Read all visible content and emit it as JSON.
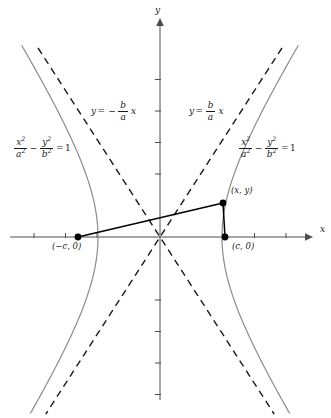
{
  "figure": {
    "type": "hyperbola-diagram",
    "width": 331,
    "height": 418,
    "background": "#ffffff",
    "curve_color": "#8c8c8c",
    "axis_color": "#4d4d4d",
    "asymptote_color": "#1a1a1a",
    "segment_color": "#000000",
    "text_color": "#1a1a1a"
  },
  "axes": {
    "x_label": "x",
    "y_label": "y",
    "origin": {
      "x": 160,
      "y": 237
    },
    "x_range": [
      10,
      312
    ],
    "y_range": [
      20,
      400
    ],
    "tick_spacing": 31.5,
    "x_ticks": [
      -4,
      -3,
      -2,
      2,
      3,
      4
    ],
    "y_ticks": [
      -5,
      -4,
      -3,
      -2,
      2,
      3,
      4,
      5
    ]
  },
  "chart_data": {
    "type": "line",
    "title": "",
    "xlabel": "x",
    "ylabel": "y",
    "curves": [
      {
        "name": "hyperbola-right-branch",
        "equation": "x^2/a^2 - y^2/b^2 = 1",
        "style": "solid",
        "color": "#8c8c8c"
      },
      {
        "name": "hyperbola-left-branch",
        "equation": "x^2/a^2 - y^2/b^2 = 1",
        "style": "solid",
        "color": "#8c8c8c"
      },
      {
        "name": "asymptote-positive-slope",
        "equation": "y = (b/a) x",
        "style": "dashed",
        "color": "#1a1a1a"
      },
      {
        "name": "asymptote-negative-slope",
        "equation": "y = -(b/a) x",
        "style": "dashed",
        "color": "#1a1a1a"
      }
    ],
    "geometry": {
      "a_pixels": 62,
      "b_over_a": 1.55,
      "center_px": [
        160,
        237
      ],
      "vertices_px": [
        [
          98,
          237
        ],
        [
          222,
          237
        ]
      ]
    },
    "points": [
      {
        "name": "focus-left",
        "label": "(−c, 0)",
        "px": [
          78,
          237
        ]
      },
      {
        "name": "point-on-curve",
        "label": "(x, y)",
        "px": [
          223,
          203
        ]
      },
      {
        "name": "focus-right",
        "label": "(c, 0)",
        "px": [
          225,
          237
        ]
      }
    ],
    "segments": [
      {
        "name": "focal-radius-left",
        "from": "focus-left",
        "to": "point-on-curve"
      },
      {
        "name": "focal-radius-right",
        "from": "focus-right",
        "to": "point-on-curve"
      }
    ]
  },
  "labels": {
    "axis_x": "x",
    "axis_y": "y",
    "asymptote_left": {
      "y": "y",
      "equals": "=",
      "minus": "−",
      "num": "b",
      "den": "a",
      "var": "x"
    },
    "asymptote_right": {
      "y": "y",
      "equals": "=",
      "num": "b",
      "den": "a",
      "var": "x"
    },
    "equation_left": {
      "num1": "x",
      "num1_sup": "2",
      "den1": "a",
      "den1_sup": "2",
      "minus": "−",
      "num2": "y",
      "num2_sup": "2",
      "den2": "b",
      "den2_sup": "2",
      "equals": "=",
      "rhs": "1"
    },
    "equation_right": {
      "num1": "x",
      "num1_sup": "2",
      "den1": "a",
      "den1_sup": "2",
      "minus": "−",
      "num2": "y",
      "num2_sup": "2",
      "den2": "b",
      "den2_sup": "2",
      "equals": "=",
      "rhs": "1"
    },
    "focus_left": "(−c, 0)",
    "focus_right": "(c, 0)",
    "point_xy": "(x, y)"
  }
}
